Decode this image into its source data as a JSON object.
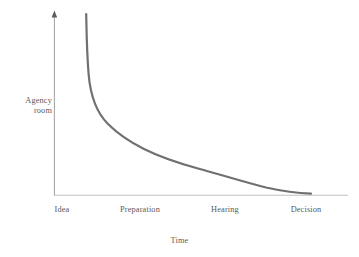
{
  "chart_data": {
    "type": "line",
    "title": "",
    "subtitle": "",
    "xlabel": "Time",
    "ylabel": "Agency room",
    "ylabel_line1": "Agency",
    "ylabel_line2": "room",
    "categories": [
      "Idea",
      "Preparation",
      "Hearing",
      "Decision"
    ],
    "x": [
      0,
      1,
      2,
      3
    ],
    "series": [
      {
        "name": "Agency room over time",
        "values": [
          100,
          26,
          11,
          2
        ],
        "points": [
          {
            "x": 0.0,
            "y": 100
          },
          {
            "x": 0.05,
            "y": 72
          },
          {
            "x": 0.12,
            "y": 55
          },
          {
            "x": 0.22,
            "y": 44
          },
          {
            "x": 0.4,
            "y": 34
          },
          {
            "x": 0.6,
            "y": 28
          },
          {
            "x": 1.0,
            "y": 26
          },
          {
            "x": 1.4,
            "y": 19
          },
          {
            "x": 2.0,
            "y": 11
          },
          {
            "x": 2.5,
            "y": 5
          },
          {
            "x": 3.0,
            "y": 2
          }
        ],
        "color": "#707070",
        "line_width": 2.2
      }
    ],
    "xlim": [
      0,
      3.3
    ],
    "ylim": [
      0,
      105
    ],
    "grid": false,
    "legend": false,
    "legend_position": "none",
    "annotations": [],
    "axis": {
      "y_arrow": true,
      "x_arrow": false,
      "axis_color": "#b7b7b7",
      "y_axis_color": "#9a9a9a"
    }
  },
  "colors": {
    "background": "#ffffff",
    "curve": "#707070",
    "axis": "#b7b7b7",
    "text": "#5a5a5a"
  }
}
